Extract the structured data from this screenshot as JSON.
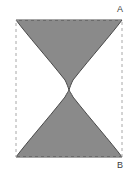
{
  "figure": {
    "title": "",
    "type": "geometric-shaded-region-diagram",
    "labels": [
      {
        "id": "A",
        "text": "A",
        "position": "top-right-outside",
        "x": 117,
        "y": 5
      },
      {
        "id": "B",
        "text": "B",
        "position": "bottom-right-outside",
        "x": 117,
        "y": 161
      }
    ],
    "colors": {
      "shaded_fill": "#8a8a8a",
      "shaded_stroke": "#4a4a4a",
      "boundary_dash": "#a8a8a8",
      "background": "#ffffff",
      "label_text": "#3c3c3c"
    },
    "bounding_box": {
      "name": "dashed-rectangle",
      "left": 16,
      "top": 20,
      "right": 122,
      "bottom": 157,
      "width": 106,
      "height": 137,
      "stroke_style": "dashed"
    },
    "regions": [
      {
        "name": "upper-shaded-region",
        "description": "Shaded area hanging from the top edge, concave sides sweeping inward to a central cusp",
        "anchor_edge": "top",
        "cusp": {
          "x": 69,
          "y": 90
        }
      },
      {
        "name": "lower-shaded-region",
        "description": "Shaded area rising from the bottom edge, concave sides sweeping inward to a central cusp",
        "anchor_edge": "bottom",
        "cusp": {
          "x": 69,
          "y": 90
        }
      }
    ],
    "voids": [
      {
        "name": "left-white-void",
        "description": "White lens-shaped gap between left dashed edge and shaded curves"
      },
      {
        "name": "right-white-void",
        "description": "White lens-shaped gap between right dashed edge and shaded curves"
      }
    ],
    "waist": {
      "name": "central-pinch-point",
      "x": 69,
      "y": 90,
      "width_px": 1
    }
  }
}
